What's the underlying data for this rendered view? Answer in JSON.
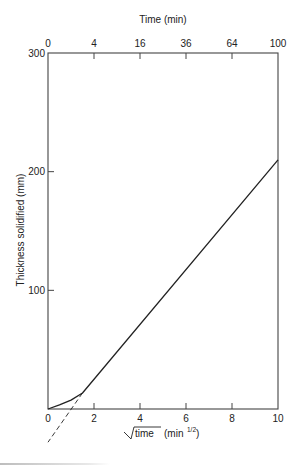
{
  "chart_data": {
    "type": "line",
    "title": "",
    "xlabel": "√time (min^1/2)",
    "xlabel_parts": {
      "radicand": "time",
      "unit_open": "(min",
      "unit_sup": "1/2",
      "unit_close": ")"
    },
    "ylabel": "Thickness solidified (mm)",
    "top_xlabel": "Time (min)",
    "xlim": [
      0,
      10
    ],
    "ylim": [
      0,
      300
    ],
    "x_ticks": [
      0,
      2,
      4,
      6,
      8,
      10
    ],
    "x_tick_labels": [
      "0",
      "2",
      "4",
      "6",
      "8",
      "10"
    ],
    "top_x_ticks": [
      0,
      2,
      4,
      6,
      8,
      10
    ],
    "top_x_tick_labels": [
      "0",
      "4",
      "16",
      "36",
      "64",
      "100"
    ],
    "y_ticks": [
      0,
      100,
      200,
      300
    ],
    "y_tick_labels": [
      "0",
      "100",
      "200",
      "300"
    ],
    "grid": false,
    "legend": null,
    "series": [
      {
        "name": "measured thickness",
        "style": "solid",
        "x": [
          0,
          0.5,
          1.0,
          1.5,
          10
        ],
        "y": [
          0,
          3.5,
          7.5,
          13.5,
          210
        ]
      },
      {
        "name": "linear extrapolation",
        "style": "dashed",
        "x": [
          1.5,
          0
        ],
        "y": [
          13.5,
          -28
        ]
      }
    ]
  }
}
